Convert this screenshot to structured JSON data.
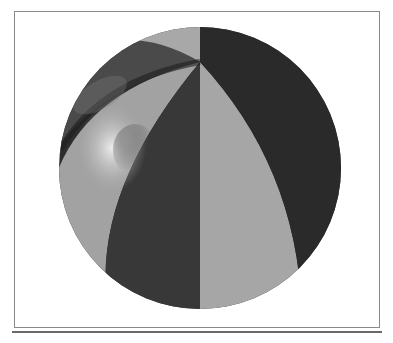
{
  "figure": {
    "colors": {
      "background": "#ffffff",
      "frame": "#8a8a8a",
      "rule": "#6a6a6a",
      "light_gore": "#a6a6a6",
      "dark_gore": "#3a3a3a",
      "darkest_gore": "#2c2c2c",
      "highlight": "#e6e6e6"
    }
  }
}
